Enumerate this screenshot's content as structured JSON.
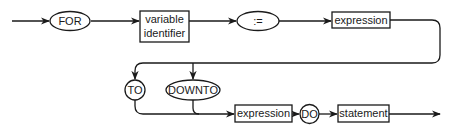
{
  "diagram": {
    "type": "syntax-diagram",
    "colors": {
      "line": "#1a1a1a",
      "background": "#ffffff"
    },
    "nodes": [
      {
        "id": "for",
        "kind": "terminal",
        "shape": "ellipse",
        "label": "FOR"
      },
      {
        "id": "var",
        "kind": "nonterminal",
        "shape": "box",
        "label_line1": "variable",
        "label_line2": "identifier"
      },
      {
        "id": "assign",
        "kind": "terminal",
        "shape": "ellipse",
        "label": ":="
      },
      {
        "id": "expr1",
        "kind": "nonterminal",
        "shape": "box",
        "label": "expression"
      },
      {
        "id": "to",
        "kind": "terminal",
        "shape": "circle",
        "label": "TO"
      },
      {
        "id": "downto",
        "kind": "terminal",
        "shape": "ellipse",
        "label": "DOWNTO"
      },
      {
        "id": "expr2",
        "kind": "nonterminal",
        "shape": "box",
        "label": "expression"
      },
      {
        "id": "do",
        "kind": "terminal",
        "shape": "circle",
        "label": "DO"
      },
      {
        "id": "stmt",
        "kind": "nonterminal",
        "shape": "box",
        "label": "statement"
      }
    ],
    "edges": [
      [
        "start",
        "for"
      ],
      [
        "for",
        "var"
      ],
      [
        "var",
        "assign"
      ],
      [
        "assign",
        "expr1"
      ],
      [
        "expr1",
        "to"
      ],
      [
        "expr1",
        "downto"
      ],
      [
        "to",
        "expr2"
      ],
      [
        "downto",
        "expr2"
      ],
      [
        "expr2",
        "do"
      ],
      [
        "do",
        "stmt"
      ],
      [
        "stmt",
        "end"
      ]
    ]
  }
}
